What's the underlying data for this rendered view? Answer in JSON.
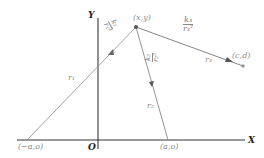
{
  "diagram": {
    "axes": {
      "x_label": "X",
      "y_label": "Y",
      "origin_label": "O"
    },
    "points": {
      "p": {
        "label": "(x,y)"
      },
      "left": {
        "label": "(−a,o)"
      },
      "right": {
        "label": "(a,o)"
      },
      "c": {
        "label": "(c,d)"
      }
    },
    "segments": {
      "r1": {
        "label": "r₁",
        "force_num": "k₁",
        "force_den": "r₁²"
      },
      "r2": {
        "label": "r₂",
        "force_num": "k₂",
        "force_den": "r₂²"
      },
      "r3": {
        "label": "r₃",
        "force_num": "k₃",
        "force_den": "r₃²"
      }
    },
    "colors": {
      "axis": "#222222",
      "line": "#8c8c8c",
      "arrow": "#555555",
      "point": "#666666"
    }
  }
}
